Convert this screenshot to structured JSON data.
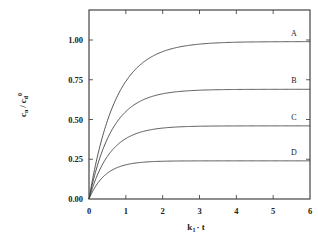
{
  "chart_data": {
    "type": "line",
    "title": "",
    "xlabel": "k1 · t",
    "ylabel": "cn / cd0",
    "xlim": [
      0,
      6
    ],
    "ylim": [
      0,
      1.18
    ],
    "xticks": [
      0,
      1,
      2,
      3,
      4,
      5,
      6
    ],
    "xtick_labels": [
      "0",
      "1",
      "2",
      "3",
      "4",
      "5",
      "6"
    ],
    "yticks": [
      0.0,
      0.25,
      0.5,
      0.75,
      1.0
    ],
    "ytick_labels": [
      "0.00",
      "0.25",
      "0.50",
      "0.75",
      "1.00"
    ],
    "grid": false,
    "legend": "inline labels at right end of curves",
    "x": [
      0,
      0.25,
      0.5,
      0.75,
      1,
      1.5,
      2,
      2.5,
      3,
      3.5,
      4,
      4.5,
      5,
      5.5,
      6
    ],
    "series": [
      {
        "name": "A",
        "values": [
          0,
          0.29,
          0.49,
          0.64,
          0.74,
          0.87,
          0.93,
          0.96,
          0.98,
          0.985,
          0.99,
          0.99,
          0.99,
          0.99,
          0.99
        ]
      },
      {
        "name": "B",
        "values": [
          0,
          0.24,
          0.39,
          0.49,
          0.55,
          0.62,
          0.66,
          0.675,
          0.685,
          0.69,
          0.69,
          0.69,
          0.69,
          0.69,
          0.69
        ]
      },
      {
        "name": "C",
        "values": [
          0,
          0.19,
          0.29,
          0.35,
          0.38,
          0.42,
          0.44,
          0.45,
          0.455,
          0.46,
          0.46,
          0.46,
          0.46,
          0.46,
          0.46
        ]
      },
      {
        "name": "D",
        "values": [
          0,
          0.12,
          0.18,
          0.2,
          0.215,
          0.23,
          0.235,
          0.24,
          0.24,
          0.24,
          0.24,
          0.24,
          0.24,
          0.24,
          0.24
        ]
      }
    ]
  },
  "labels": {
    "x_axis": "k",
    "x_axis_sub": "1",
    "x_axis_rest": "· t",
    "y_axis_c1": "c",
    "y_axis_sub1": "n",
    "y_axis_slash": "/",
    "y_axis_c2": "c",
    "y_axis_sub2": "d",
    "y_axis_sup2": "0"
  }
}
